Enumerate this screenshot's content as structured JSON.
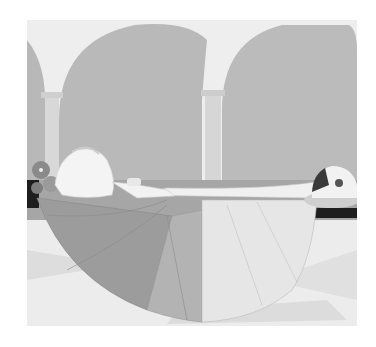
{
  "artwork": {
    "description": "Grayscale illustration of a figure lying on a bier with a large fanned skirt, in an arcaded hall with columns; a small dog-like creature rests on a cushion at right",
    "colors": {
      "background": "#ffffff",
      "sky": "#eeeeee",
      "arch_wall": "#b9b9b9",
      "column": "#d8d8d8",
      "ledge_dark": "#1e1e1e",
      "ledge_mid": "#9c9c9c",
      "floor": "#ececec",
      "skirt_dark": "#9a9a9a",
      "skirt_mid": "#b2b2b2",
      "skirt_light": "#e6e6e6",
      "figure_white": "#f4f4f4",
      "flowers": "#8a8a8a"
    }
  }
}
